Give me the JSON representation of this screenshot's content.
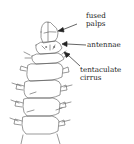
{
  "diagram": {
    "labels": [
      {
        "id": "fused-palps",
        "line1": "fused",
        "line2": "palps"
      },
      {
        "id": "antennae",
        "line1": "antennae"
      },
      {
        "id": "tentaculate-cirrus",
        "line1": "tentaculate",
        "line2": "cirrus"
      }
    ],
    "colors": {
      "line": "#444444",
      "text": "#222222",
      "background": "#ffffff"
    }
  }
}
